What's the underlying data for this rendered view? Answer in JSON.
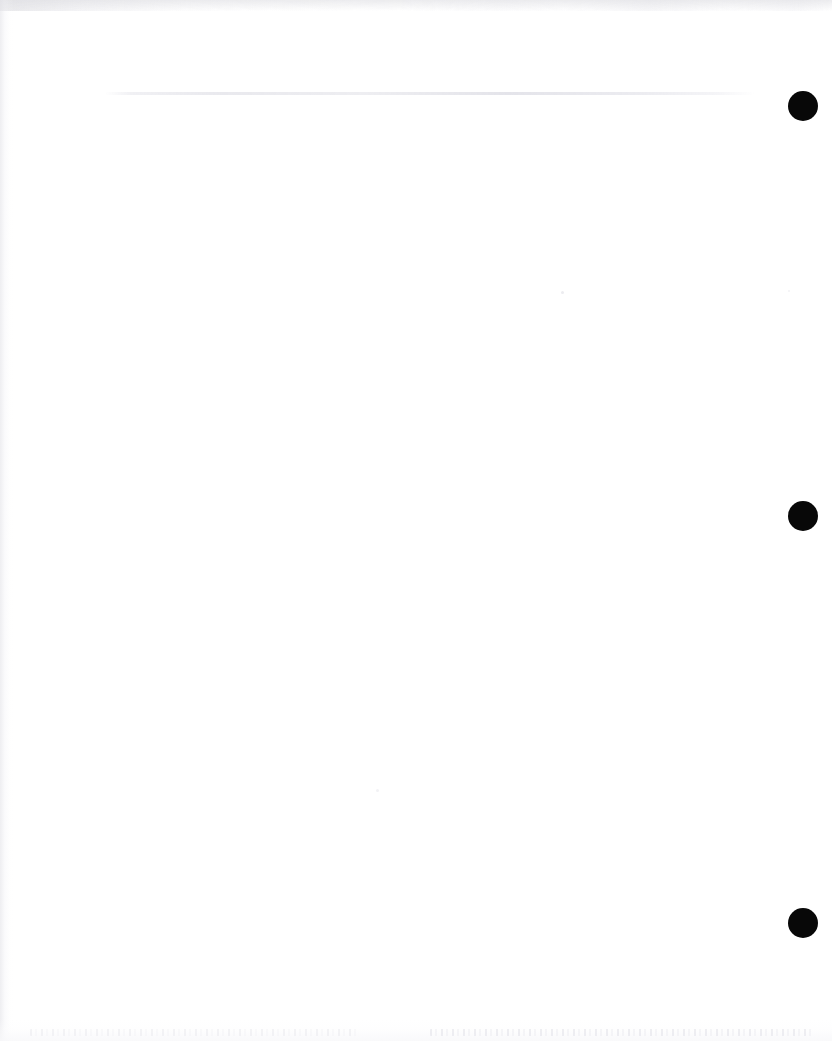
{
  "page": {
    "kind": "scanned-document-page",
    "content_text": "",
    "width_px": 832,
    "height_px": 1041,
    "background_color": "#ffffff"
  },
  "artifacts": {
    "ruled_line": {
      "name": "faint-horizontal-line",
      "color": "#ebebef",
      "x_start_px": 105,
      "x_end_px": 755,
      "y_px": 93,
      "thickness_px": 2
    },
    "top_edge_band": {
      "name": "scan-top-edge-shadow",
      "color": "#e2e2e6",
      "height_px": 11
    },
    "left_edge_shadow": {
      "name": "scan-left-edge-shadow",
      "color": "#e4e4e9",
      "width_px": 14
    },
    "bottom_ghost_text": {
      "name": "faded-bottom-text-ghost",
      "color": "#ececf0",
      "legible": false,
      "text": ""
    }
  },
  "punch_holes": [
    {
      "label": "hole-1",
      "color": "#080808",
      "cx_px": 803,
      "cy_px": 106,
      "diameter_px": 30
    },
    {
      "label": "hole-2",
      "color": "#080808",
      "cx_px": 803,
      "cy_px": 516,
      "diameter_px": 30
    },
    {
      "label": "hole-3",
      "color": "#080808",
      "cx_px": 803,
      "cy_px": 923,
      "diameter_px": 30
    }
  ],
  "specks": [
    {
      "label": "speck-1",
      "color": "#ececf0",
      "cx_px": 562,
      "cy_px": 292,
      "diameter_px": 3
    },
    {
      "label": "speck-2",
      "color": "#f2f2f5",
      "cx_px": 377,
      "cy_px": 790,
      "diameter_px": 3
    },
    {
      "label": "speck-3",
      "color": "#f2f2f5",
      "cx_px": 789,
      "cy_px": 291,
      "diameter_px": 2
    }
  ]
}
